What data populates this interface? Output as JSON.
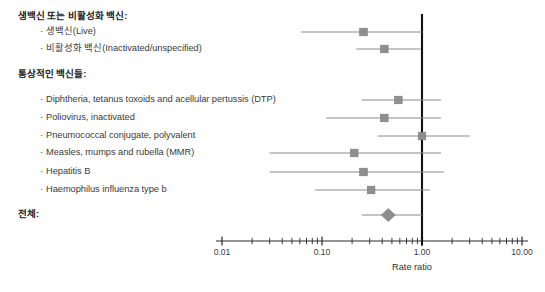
{
  "figure": {
    "kind": "forest-plot",
    "background_color": "#ffffff",
    "marker_color": "#8f8f8f",
    "marker_edge_color": "#7a7a7a",
    "ci_line_color": "#8a8a8a",
    "reference_line_color": "#111111",
    "axis_color": "#2b2b2b"
  },
  "axis": {
    "label": "Rate ratio",
    "scale": "log10",
    "min": 0.01,
    "max": 10.0,
    "reference_value": 1.0,
    "major_ticks": [
      {
        "value": 0.01,
        "label": "0.01"
      },
      {
        "value": 0.1,
        "label": "0.10"
      },
      {
        "value": 1.0,
        "label": "1.00"
      },
      {
        "value": 10.0,
        "label": "10.00"
      }
    ],
    "minor_ticks": [
      0.02,
      0.03,
      0.04,
      0.05,
      0.06,
      0.07,
      0.08,
      0.09,
      0.2,
      0.3,
      0.4,
      0.5,
      0.6,
      0.7,
      0.8,
      0.9,
      2,
      3,
      4,
      5,
      6,
      7,
      8,
      9
    ]
  },
  "groups": [
    {
      "id": "group-1",
      "label": "생백신 또는 비활성화 백신:"
    },
    {
      "id": "group-2",
      "label": "통상적인 백신들:"
    },
    {
      "id": "group-3",
      "label": "전체:"
    }
  ],
  "rows": [
    {
      "id": "row-group-header-1",
      "type": "header",
      "label": "생백신 또는 비활성화 백신:",
      "y": 16
    },
    {
      "id": "row-live",
      "type": "estimate",
      "label": "생백신(Live)",
      "y": 32,
      "estimate": 0.26,
      "ci_low": 0.062,
      "ci_high": 1.0,
      "marker": "square"
    },
    {
      "id": "row-inactivated",
      "type": "estimate",
      "label": "비활성화 백신(Inactivated/unspecified)",
      "y": 49,
      "estimate": 0.42,
      "ci_low": 0.22,
      "ci_high": 0.97,
      "marker": "square"
    },
    {
      "id": "row-group-header-2",
      "type": "header",
      "label": "통상적인 백신들:",
      "y": 74
    },
    {
      "id": "row-dtp",
      "type": "estimate",
      "label": "Diphtheria, tetanus toxoids and acellular pertussis (DTP)",
      "y": 100,
      "estimate": 0.58,
      "ci_low": 0.25,
      "ci_high": 1.55,
      "marker": "square"
    },
    {
      "id": "row-polio",
      "type": "estimate",
      "label": "Poliovirus, inactivated",
      "y": 118,
      "estimate": 0.42,
      "ci_low": 0.11,
      "ci_high": 1.55,
      "marker": "square"
    },
    {
      "id": "row-pneumococcal",
      "type": "estimate",
      "label": "Pneumococcal conjugate, polyvalent",
      "y": 136,
      "estimate": 1.0,
      "ci_low": 0.36,
      "ci_high": 3.0,
      "marker": "square"
    },
    {
      "id": "row-mmr",
      "type": "estimate",
      "label": "Measles, mumps and rubella (MMR)",
      "y": 153,
      "estimate": 0.21,
      "ci_low": 0.03,
      "ci_high": 1.55,
      "marker": "square"
    },
    {
      "id": "row-hepb",
      "type": "estimate",
      "label": "Hepatitis B",
      "y": 172,
      "estimate": 0.26,
      "ci_low": 0.03,
      "ci_high": 1.65,
      "marker": "square"
    },
    {
      "id": "row-hib",
      "type": "estimate",
      "label": "Haemophilus influenza type b",
      "y": 190,
      "estimate": 0.31,
      "ci_low": 0.085,
      "ci_high": 1.2,
      "marker": "square"
    },
    {
      "id": "row-overall-header",
      "type": "header",
      "label": "전체:",
      "y": 214
    },
    {
      "id": "row-overall",
      "type": "summary",
      "label": "",
      "y": 215,
      "estimate": 0.46,
      "ci_low": 0.25,
      "ci_high": 1.0,
      "marker": "diamond"
    }
  ],
  "chart_data": {
    "type": "forest",
    "title": "",
    "xlabel": "Rate ratio",
    "ylabel": "",
    "xscale": "log",
    "xlim": [
      0.01,
      10.0
    ],
    "reference_line": 1.0,
    "grid": false,
    "legend": "none",
    "categories": [
      "생백신(Live)",
      "비활성화 백신(Inactivated/unspecified)",
      "Diphtheria, tetanus toxoids and acellular pertussis (DTP)",
      "Poliovirus, inactivated",
      "Pneumococcal conjugate, polyvalent",
      "Measles, mumps and rubella (MMR)",
      "Hepatitis B",
      "Haemophilus influenza type b",
      "전체"
    ],
    "values": [
      0.26,
      0.42,
      0.58,
      0.42,
      1.0,
      0.21,
      0.26,
      0.31,
      0.46
    ],
    "ci_low": [
      0.062,
      0.22,
      0.25,
      0.11,
      0.36,
      0.03,
      0.03,
      0.085,
      0.25
    ],
    "ci_high": [
      1.0,
      0.97,
      1.55,
      1.55,
      3.0,
      1.55,
      1.65,
      1.2,
      1.0
    ],
    "tick_labels": [
      "0.01",
      "0.10",
      "1.00",
      "10.00"
    ],
    "tick_values": [
      0.01,
      0.1,
      1.0,
      10.0
    ]
  },
  "geometry": {
    "plot_left": 222,
    "plot_right": 522,
    "axis_y": 241,
    "tick_label_y": 247,
    "axis_title_y": 262,
    "axis_title_x": 412,
    "ref_line_top": 14,
    "ref_line_bottom": 241
  }
}
